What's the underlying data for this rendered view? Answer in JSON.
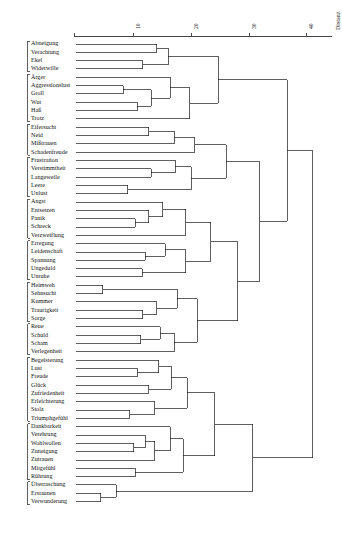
{
  "figure": {
    "type": "dendrogram",
    "axis": {
      "title": "Distanz",
      "ticks": [
        {
          "label": "10",
          "value": 10
        },
        {
          "label": "20",
          "value": 20
        },
        {
          "label": "30",
          "value": 30
        },
        {
          "label": "40",
          "value": 40
        }
      ],
      "range": [
        0,
        44
      ],
      "position": "top",
      "direction": "left-to-right"
    },
    "leaves": [
      "Abneigung",
      "Verachtung",
      "Ekel",
      "Widerwille",
      "Ärger",
      "Aggressionslust",
      "Groll",
      "Wut",
      "Haß",
      "Trotz",
      "Eifersucht",
      "Neid",
      "Mißtrauen",
      "Schadenfreude",
      "Frustration",
      "Verstimmtheit",
      "Langeweile",
      "Leere",
      "Unlust",
      "Angst",
      "Entsetzen",
      "Panik",
      "Schreck",
      "Verzweiflung",
      "Erregung",
      "Leidenschaft",
      "Spannung",
      "Ungeduld",
      "Unruhe",
      "Heimweh",
      "Sehnsucht",
      "Kummer",
      "Traurigkeit",
      "Sorge",
      "Reue",
      "Schuld",
      "Scham",
      "Verlegenheit",
      "Begeisterung",
      "Lust",
      "Freude",
      "Glück",
      "Zufriedenheit",
      "Erleichterung",
      "Stolz",
      "Triumphgefühl",
      "Dankbarkeit",
      "Verehrung",
      "Wohlwollen",
      "Zuneigung",
      "Zutrauen",
      "Mitgefühl",
      "Rührung",
      "Überraschung",
      "Erstaunen",
      "Verwunderung"
    ],
    "brackets": [
      {
        "from": 0,
        "to": 3
      },
      {
        "from": 4,
        "to": 9
      },
      {
        "from": 10,
        "to": 13
      },
      {
        "from": 14,
        "to": 18
      },
      {
        "from": 19,
        "to": 23
      },
      {
        "from": 24,
        "to": 28
      },
      {
        "from": 29,
        "to": 33
      },
      {
        "from": 34,
        "to": 37
      },
      {
        "from": 38,
        "to": 45
      },
      {
        "from": 46,
        "to": 52
      },
      {
        "from": 53,
        "to": 55
      }
    ],
    "merges": [
      {
        "a": {
          "leaf": 2
        },
        "b": {
          "leaf": 3
        },
        "height": 11.6
      },
      {
        "a": {
          "leaf": 0
        },
        "b": {
          "leaf": 1
        },
        "height": 14.0
      },
      {
        "a": {
          "node": 0
        },
        "b": {
          "node": 1
        },
        "height": 16.0
      },
      {
        "a": {
          "leaf": 7
        },
        "b": {
          "leaf": 8
        },
        "height": 10.6
      },
      {
        "a": {
          "leaf": 5
        },
        "b": {
          "leaf": 6
        },
        "height": 8.2
      },
      {
        "a": {
          "node": 4
        },
        "b": {
          "node": 3
        },
        "height": 13.0
      },
      {
        "a": {
          "leaf": 4
        },
        "b": {
          "node": 5
        },
        "height": 16.3
      },
      {
        "a": {
          "node": 6
        },
        "b": {
          "leaf": 9
        },
        "height": 19.7
      },
      {
        "a": {
          "node": 2
        },
        "b": {
          "node": 7
        },
        "height": 24.6
      },
      {
        "a": {
          "leaf": 10
        },
        "b": {
          "leaf": 11
        },
        "height": 12.6
      },
      {
        "a": {
          "node": 9
        },
        "b": {
          "leaf": 12
        },
        "height": 17.0
      },
      {
        "a": {
          "node": 10
        },
        "b": {
          "leaf": 13
        },
        "height": 20.6
      },
      {
        "a": {
          "leaf": 15
        },
        "b": {
          "leaf": 16
        },
        "height": 13.0
      },
      {
        "a": {
          "leaf": 14
        },
        "b": {
          "node": 12
        },
        "height": 17.2
      },
      {
        "a": {
          "leaf": 17
        },
        "b": {
          "leaf": 18
        },
        "height": 9.0
      },
      {
        "a": {
          "node": 14
        },
        "b": {
          "node": 13
        },
        "height": 20.0
      },
      {
        "a": {
          "node": 11
        },
        "b": {
          "node": 15
        },
        "height": 26.0
      },
      {
        "a": {
          "leaf": 21
        },
        "b": {
          "leaf": 22
        },
        "height": 10.3
      },
      {
        "a": {
          "leaf": 20
        },
        "b": {
          "node": 17
        },
        "height": 12.6
      },
      {
        "a": {
          "leaf": 19
        },
        "b": {
          "node": 18
        },
        "height": 15.0
      },
      {
        "a": {
          "node": 19
        },
        "b": {
          "leaf": 23
        },
        "height": 19.0
      },
      {
        "a": {
          "leaf": 25
        },
        "b": {
          "leaf": 26
        },
        "height": 12.0
      },
      {
        "a": {
          "leaf": 24
        },
        "b": {
          "node": 21
        },
        "height": 15.5
      },
      {
        "a": {
          "leaf": 27
        },
        "b": {
          "leaf": 28
        },
        "height": 11.5
      },
      {
        "a": {
          "node": 22
        },
        "b": {
          "node": 23
        },
        "height": 19.0
      },
      {
        "a": {
          "node": 20
        },
        "b": {
          "node": 24
        },
        "height": 23.3
      },
      {
        "a": {
          "leaf": 29
        },
        "b": {
          "leaf": 30
        },
        "height": 4.6
      },
      {
        "a": {
          "leaf": 32
        },
        "b": {
          "leaf": 33
        },
        "height": 11.6
      },
      {
        "a": {
          "leaf": 31
        },
        "b": {
          "node": 27
        },
        "height": 14.0
      },
      {
        "a": {
          "node": 26
        },
        "b": {
          "node": 28
        },
        "height": 17.5
      },
      {
        "a": {
          "leaf": 35
        },
        "b": {
          "leaf": 36
        },
        "height": 11.2
      },
      {
        "a": {
          "leaf": 34
        },
        "b": {
          "node": 30
        },
        "height": 14.6
      },
      {
        "a": {
          "node": 31
        },
        "b": {
          "leaf": 37
        },
        "height": 17.0
      },
      {
        "a": {
          "node": 29
        },
        "b": {
          "node": 32
        },
        "height": 21.0
      },
      {
        "a": {
          "node": 25
        },
        "b": {
          "node": 33
        },
        "height": 28.0
      },
      {
        "a": {
          "node": 16
        },
        "b": {
          "node": 34
        },
        "height": 31.8
      },
      {
        "a": {
          "node": 8
        },
        "b": {
          "node": 35
        },
        "height": 36.6
      },
      {
        "a": {
          "leaf": 39
        },
        "b": {
          "leaf": 40
        },
        "height": 10.6
      },
      {
        "a": {
          "leaf": 38
        },
        "b": {
          "node": 37
        },
        "height": 14.3
      },
      {
        "a": {
          "leaf": 41
        },
        "b": {
          "leaf": 42
        },
        "height": 12.6
      },
      {
        "a": {
          "node": 39
        },
        "b": {
          "node": 38
        },
        "height": 16.5
      },
      {
        "a": {
          "leaf": 44
        },
        "b": {
          "leaf": 45
        },
        "height": 9.3
      },
      {
        "a": {
          "leaf": 43
        },
        "b": {
          "node": 41
        },
        "height": 13.6
      },
      {
        "a": {
          "node": 40
        },
        "b": {
          "node": 42
        },
        "height": 19.3
      },
      {
        "a": {
          "leaf": 48
        },
        "b": {
          "leaf": 49
        },
        "height": 10.0
      },
      {
        "a": {
          "leaf": 47
        },
        "b": {
          "node": 44
        },
        "height": 12.0
      },
      {
        "a": {
          "node": 45
        },
        "b": {
          "leaf": 50
        },
        "height": 13.6
      },
      {
        "a": {
          "leaf": 46
        },
        "b": {
          "node": 46
        },
        "height": 16.3
      },
      {
        "a": {
          "leaf": 51
        },
        "b": {
          "leaf": 52
        },
        "height": 10.3
      },
      {
        "a": {
          "node": 47
        },
        "b": {
          "node": 48
        },
        "height": 18.6
      },
      {
        "a": {
          "node": 43
        },
        "b": {
          "node": 49
        },
        "height": 24.0
      },
      {
        "a": {
          "leaf": 54
        },
        "b": {
          "leaf": 55
        },
        "height": 4.3
      },
      {
        "a": {
          "leaf": 53
        },
        "b": {
          "node": 51
        },
        "height": 7.0
      },
      {
        "a": {
          "node": 50
        },
        "b": {
          "node": 52
        },
        "height": 30.6
      },
      {
        "a": {
          "node": 36
        },
        "b": {
          "node": 53
        },
        "height": 41.0
      }
    ]
  }
}
